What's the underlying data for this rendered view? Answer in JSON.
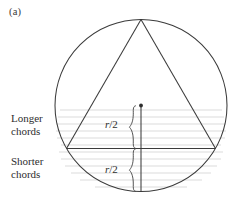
{
  "figure": {
    "panel_label": "(a)",
    "width": 235,
    "height": 203,
    "background": "#ffffff"
  },
  "labels": {
    "longer_line1": "Longer",
    "longer_line2": "chords",
    "shorter_line1": "Shorter",
    "shorter_line2": "chords",
    "radius_upper": "r/2",
    "radius_lower": "r/2",
    "radius_upper_num": "r",
    "radius_upper_slash": "/",
    "radius_upper_den": "2",
    "radius_lower_num": "r",
    "radius_lower_slash": "/",
    "radius_lower_den": "2"
  },
  "colors": {
    "stroke": "#3b3b3b",
    "chord_gray": "#c9c9c9",
    "text": "#2e2e2e",
    "background": "#ffffff"
  },
  "geometry": {
    "circle": {
      "cx": 141,
      "cy": 105.5,
      "r": 86
    },
    "triangle": {
      "apex": [
        141,
        19.5
      ],
      "left": [
        66.5,
        148.5
      ],
      "right": [
        215.5,
        148.5
      ]
    },
    "base_chord_y": 148.5,
    "vertical_line": {
      "x": 141,
      "y_top": 105.5,
      "y_bottom": 191.5
    },
    "dot": {
      "cx": 141,
      "cy": 105.5,
      "r": 1.8
    },
    "brace_upper": {
      "x": 132,
      "y_top": 105.5,
      "y_bottom": 148.5
    },
    "brace_lower": {
      "x": 132,
      "y_top": 148.5,
      "y_bottom": 191.5
    },
    "chord_lines_upper_y": [
      110,
      117,
      124,
      131,
      138,
      145
    ],
    "chord_lines_lower_y": [
      152,
      159,
      166,
      173,
      180,
      187
    ]
  }
}
